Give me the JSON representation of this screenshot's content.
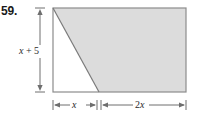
{
  "problem": {
    "number": "59."
  },
  "figure": {
    "type": "geometry-diagram",
    "shape": "trapezoid-in-rectangle",
    "fill_color": "#dcdcdc",
    "stroke_color": "#808080",
    "background_color": "#ffffff",
    "dimensions": {
      "height_label": "x + 5",
      "height_label_parts": {
        "variable": "x",
        "operator": "+",
        "constant": "5"
      },
      "bottom_left_label": "x",
      "bottom_right_label": "2x",
      "bottom_right_label_parts": {
        "coefficient": "2",
        "variable": "x"
      }
    },
    "geometry": {
      "rect_left": 53,
      "rect_right": 186,
      "rect_top": 8,
      "rect_bottom": 92,
      "diagonal_base_x": 99,
      "vertical_dim_line_x": 40,
      "bottom_dim_line_y": 105
    }
  }
}
